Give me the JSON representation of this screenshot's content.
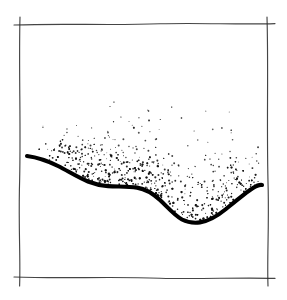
{
  "figure": {
    "title": "",
    "caption": "",
    "background_color": "#ffffff",
    "width": 287,
    "height": 300,
    "style": "hand-drawn pen-and-ink sketch"
  },
  "frame": {
    "name": "hand-drawn-rectangular-border",
    "stroke_color": "#2b2b2b",
    "stroke_width": 1.15,
    "corners_overshoot": true,
    "bounds": {
      "left": 20,
      "top": 24,
      "right": 268,
      "bottom": 278
    },
    "edges": [
      {
        "id": "top",
        "path": "M 14 25 C 60 23.2, 110 25.6, 160 23.8 C 200 22.6, 240 24.8, 275 23.6"
      },
      {
        "id": "right",
        "path": "M 267 17 C 268.6 70, 266.4 130, 268.2 190 C 269 230, 267 260, 268 286"
      },
      {
        "id": "bottom",
        "path": "M 14 277 C 60 278.8, 110 276.4, 160 278.2 C 200 279.4, 240 277.2, 275 278.4"
      },
      {
        "id": "left",
        "path": "M 20 17 C 18.6 70, 21.2 130, 19.4 190 C 18.6 230, 20.6 260, 19.6 286"
      }
    ]
  },
  "profile_curve": {
    "name": "terrain-profile-curve",
    "description": "thick black freehand curve forming the lower boundary of the stippled region",
    "stroke_color": "#000000",
    "stroke_width": 4.1,
    "start_point": {
      "x": 27,
      "y": 156
    },
    "end_point": {
      "x": 262,
      "y": 185
    },
    "trough_point": {
      "x": 194,
      "y": 222
    },
    "plateau_range": {
      "x_start": 100,
      "x_end": 138,
      "y": 186
    },
    "path": "M 27 156 C 38 157.5, 48 161, 58 166 C 68 171, 78 177.5, 88 181.5 C 95 184.3, 100 185.6, 108 186.1 C 118 186.7, 128 186.3, 137 187.6 C 146 189, 153 193.5, 160 200 C 168 207.5, 174 215, 182 219.5 C 188 222.6, 194 223.2, 200 222.4 C 210 221, 218 215.5, 226 209 C 236 200.8, 246 192.5, 253 188 C 257 185.5, 260 184.6, 262 185"
  },
  "stipple": {
    "name": "stipple-shading-cloud",
    "description": "dotted ink stipple filling the area above the profile curve, densest immediately above the curve and fading toward the top",
    "dot_color": "#111111",
    "dot_radius_range": [
      0.45,
      1.15
    ],
    "total_dots": 760,
    "top_fade_y": 103,
    "max_density_offset_above_curve": 6,
    "x_range": [
      38,
      261
    ],
    "seed": 20240517
  },
  "chart_data": {
    "type": "area",
    "title": "",
    "xlabel": "",
    "ylabel": "",
    "grid": false,
    "legend": false,
    "x": [
      27,
      58,
      88,
      108,
      137,
      160,
      182,
      200,
      226,
      253,
      262
    ],
    "values": [
      156,
      166,
      181.5,
      186.1,
      187.6,
      200,
      219.5,
      222.4,
      209,
      188,
      185
    ]
  }
}
